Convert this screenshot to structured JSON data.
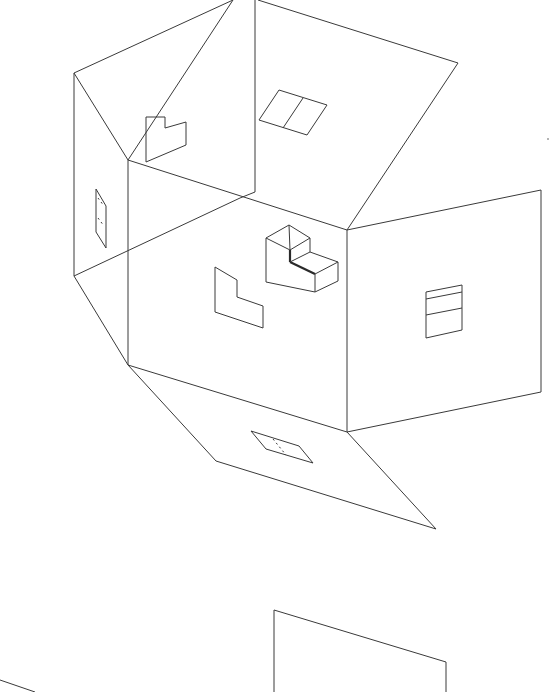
{
  "figure": {
    "title": "Unfolded net of a house with window and L-shaped cut-outs",
    "stroke_color": "#3a3a3a",
    "background": "#ffffff"
  },
  "panels": [
    {
      "name": "roof-left-triangle",
      "points": [
        [
          233,
          0
        ],
        [
          74,
          73
        ],
        [
          128,
          160
        ]
      ]
    },
    {
      "name": "roof-back-triangle",
      "points": [
        [
          233,
          0
        ],
        [
          128,
          160
        ],
        [
          255,
          192
        ]
      ]
    },
    {
      "name": "roof-right-quad",
      "points": [
        [
          258,
          0
        ],
        [
          458,
          63
        ],
        [
          347,
          230
        ],
        [
          255,
          192
        ]
      ]
    },
    {
      "name": "left-wall",
      "points": [
        [
          74,
          73
        ],
        [
          128,
          160
        ],
        [
          128,
          365
        ],
        [
          74,
          276
        ]
      ]
    },
    {
      "name": "front-wall",
      "points": [
        [
          128,
          160
        ],
        [
          347,
          230
        ],
        [
          347,
          432
        ],
        [
          128,
          365
        ]
      ]
    },
    {
      "name": "right-wall",
      "points": [
        [
          347,
          230
        ],
        [
          541,
          190
        ],
        [
          541,
          392
        ],
        [
          347,
          432
        ]
      ]
    },
    {
      "name": "floor",
      "points": [
        [
          128,
          365
        ],
        [
          347,
          432
        ],
        [
          436,
          529
        ],
        [
          216,
          461
        ]
      ]
    },
    {
      "name": "bottom-right-partial",
      "points": [
        [
          274,
          692
        ],
        [
          274,
          610
        ],
        [
          446,
          662
        ],
        [
          446,
          692
        ]
      ]
    }
  ],
  "details": {
    "roof_window": {
      "outer": [
        [
          286,
          90
        ],
        [
          326,
          104
        ],
        [
          307,
          135
        ],
        [
          258,
          120
        ]
      ],
      "divider": [
        [
          299,
          97
        ],
        [
          283,
          127
        ]
      ]
    },
    "upper_l_cutout": [
      [
        146,
        117
      ],
      [
        165,
        117
      ],
      [
        165,
        128
      ],
      [
        186,
        122
      ],
      [
        186,
        145
      ],
      [
        146,
        162
      ]
    ],
    "left_wall_door": [
      [
        96,
        188
      ],
      [
        106,
        205
      ],
      [
        106,
        248
      ],
      [
        96,
        232
      ]
    ],
    "front_l_cutout": [
      [
        215,
        267
      ],
      [
        237,
        280
      ],
      [
        237,
        297
      ],
      [
        263,
        306
      ],
      [
        263,
        328
      ],
      [
        215,
        312
      ]
    ],
    "right_wall_window": {
      "outer": [
        [
          426,
          292
        ],
        [
          462,
          285
        ],
        [
          462,
          330
        ],
        [
          426,
          338
        ]
      ],
      "bars": [
        [
          [
            426,
            298
          ],
          [
            462,
            291
          ]
        ],
        [
          [
            426,
            315
          ],
          [
            462,
            308
          ]
        ]
      ]
    },
    "floor_hatch": [
      [
        251,
        431
      ],
      [
        299,
        447
      ],
      [
        313,
        463
      ],
      [
        266,
        448
      ]
    ],
    "l_block_3d": "isometric L-shaped solid on front wall"
  },
  "extra_lines": [
    {
      "name": "crease-diagonal",
      "from": [
        74,
        276
      ],
      "to": [
        255,
        192
      ]
    },
    {
      "name": "bottom-left-fragment",
      "from": [
        0,
        680
      ],
      "to": [
        35,
        692
      ]
    }
  ]
}
